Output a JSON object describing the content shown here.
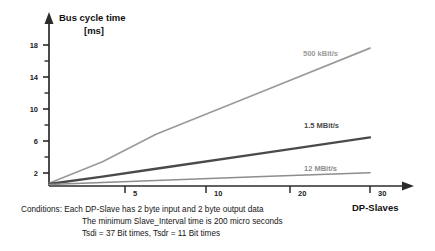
{
  "chart_data": {
    "type": "line",
    "title": "",
    "ylabel": "Bus cycle time [ms]",
    "ylabel_line1": "Bus cycle time",
    "ylabel_line2": "[ms]",
    "xlabel": "DP-Slaves",
    "xlim": [
      0,
      32
    ],
    "ylim": [
      0,
      19.6
    ],
    "grid": false,
    "legend_position": "inline-right",
    "yticks_major": [
      2,
      6,
      10,
      14,
      18
    ],
    "yticks_major_labels": [
      "2",
      "6",
      "10",
      "14",
      "18"
    ],
    "yticks_minor": [
      4,
      8,
      12,
      16
    ],
    "xticks": [
      5,
      10,
      20,
      30
    ],
    "xtick_labels": [
      "5",
      "10",
      "20",
      "30"
    ],
    "series": [
      {
        "name": "500 kBit/s",
        "color": "#9a9a9a",
        "width": 1.7,
        "x": [
          0,
          5,
          10,
          20,
          30
        ],
        "values": [
          0.35,
          3.1,
          6.6,
          12.1,
          17.6
        ]
      },
      {
        "name": "1.5 MBit/s",
        "color": "#4a4a4a",
        "width": 2.4,
        "x": [
          0,
          5,
          10,
          20,
          30
        ],
        "values": [
          0.25,
          1.2,
          2.2,
          4.2,
          6.2
        ]
      },
      {
        "name": "12 MBit/s",
        "color": "#8d8d8d",
        "width": 1.5,
        "x": [
          0,
          5,
          10,
          20,
          30
        ],
        "values": [
          0.2,
          0.45,
          0.7,
          1.2,
          1.7
        ]
      }
    ]
  },
  "labels": {
    "series_500": "500 kBit/s",
    "series_15": "1.5 MBit/s",
    "series_12": "12 MBit/s",
    "x_axis": "DP-Slaves",
    "y_axis_line1": "Bus cycle time",
    "y_axis_line2": "[ms]",
    "ytick_18": "18",
    "ytick_14": "14",
    "ytick_10": "10",
    "ytick_6": "6",
    "ytick_2": "2",
    "xtick_5": "5",
    "xtick_10": "10",
    "xtick_20": "20",
    "xtick_30": "30"
  },
  "conditions": {
    "line1": "Conditions: Each DP-Slave has 2 byte  input and 2 byte  output data",
    "line2": "The minimum Slave_Interval time is 200 micro seconds",
    "line3": "Tsdi = 37 Bit times, Tsdr = 11 Bit times"
  },
  "colors": {
    "series_500": "#9a9a9a",
    "series_15": "#4a4a4a",
    "series_12": "#8d8d8d",
    "axis": "#2b2b2b",
    "text": "#161616",
    "background": "#ffffff"
  }
}
